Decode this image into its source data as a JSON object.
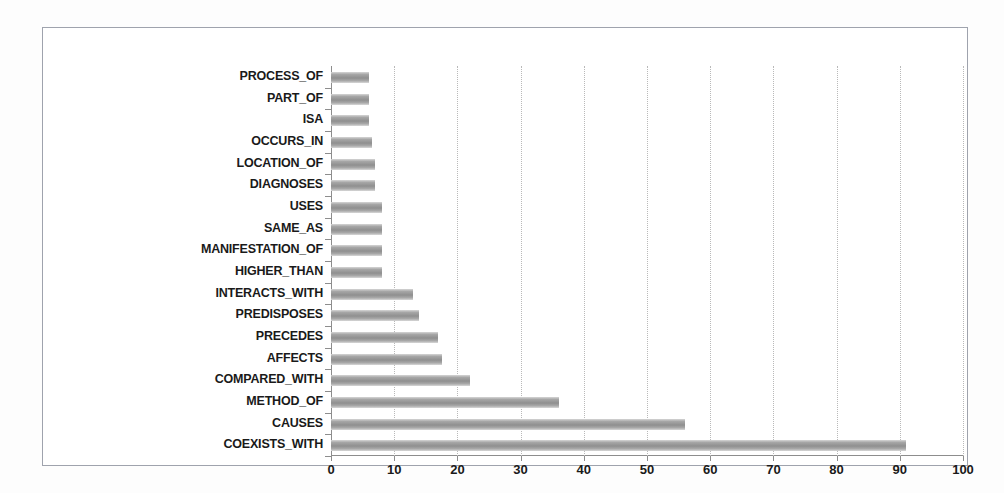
{
  "chart_data": {
    "type": "bar",
    "orientation": "horizontal",
    "title": "",
    "subtitle": "",
    "xlabel": "",
    "ylabel": "",
    "xlim": [
      0,
      100
    ],
    "xticks": [
      0,
      10,
      20,
      30,
      40,
      50,
      60,
      70,
      80,
      90,
      100
    ],
    "grid": "vertical-dotted",
    "legend": "none",
    "series_name": "",
    "categories": [
      "PROCESS_OF",
      "PART_OF",
      "ISA",
      "OCCURS_IN",
      "LOCATION_OF",
      "DIAGNOSES",
      "USES",
      "SAME_AS",
      "MANIFESTATION_OF",
      "HIGHER_THAN",
      "INTERACTS_WITH",
      "PREDISPOSES",
      "PRECEDES",
      "AFFECTS",
      "COMPARED_WITH",
      "METHOD_OF",
      "CAUSES",
      "COEXISTS_WITH"
    ],
    "values": [
      6,
      6,
      6,
      6.5,
      7,
      7,
      8,
      8,
      8,
      8,
      13,
      14,
      17,
      17.5,
      22,
      36,
      56,
      91
    ],
    "bar_color": "#9a9a9a",
    "grid_color": "#b9b9b9",
    "axis_color": "#8d8d8d",
    "frame_color": "#9fa3ad",
    "background_color": "#ffffff"
  }
}
